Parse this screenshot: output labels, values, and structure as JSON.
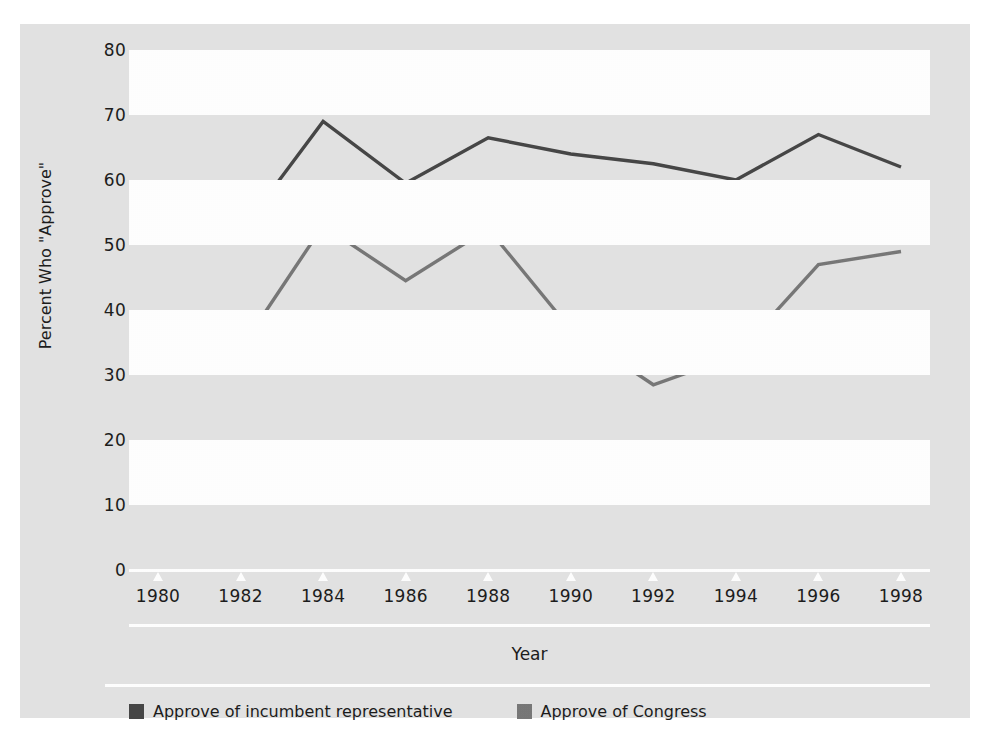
{
  "chart_data": {
    "type": "line",
    "title": "",
    "subtitle": "",
    "xlabel": "Year",
    "ylabel": "Percent Who \"Approve\"",
    "categories": [
      "1980",
      "1982",
      "1984",
      "1986",
      "1988",
      "1990",
      "1992",
      "1994",
      "1996",
      "1998"
    ],
    "x": [
      1980,
      1982,
      1984,
      1986,
      1988,
      1990,
      1992,
      1994,
      1996,
      1998
    ],
    "xlim": [
      1980,
      1998
    ],
    "ylim": [
      0,
      80
    ],
    "yticks": [
      0,
      10,
      20,
      30,
      40,
      50,
      60,
      70,
      80
    ],
    "grid": "horizontal-alternating-bands",
    "legend_position": "bottom-left",
    "series": [
      {
        "name": "Approve of incumbent representative",
        "color": "#464646",
        "values": [
          57,
          52,
          69,
          59.5,
          66.5,
          64,
          62.5,
          60,
          67,
          62
        ]
      },
      {
        "name": "Approve of Congress",
        "color": "#787878",
        "values": [
          34,
          34,
          53,
          44.5,
          52.5,
          37,
          28.5,
          33,
          47,
          49
        ]
      }
    ]
  },
  "legend": {
    "items": [
      {
        "label": "Approve of incumbent representative",
        "color": "#464646"
      },
      {
        "label": "Approve of Congress",
        "color": "#787878"
      }
    ]
  },
  "colors": {
    "panel_background": "#e3e3e3",
    "band_color": "#ffffff",
    "axis_line": "#ffffff",
    "text": "#1c1c1c",
    "series_incumbent": "#464646",
    "series_congress": "#787878"
  }
}
